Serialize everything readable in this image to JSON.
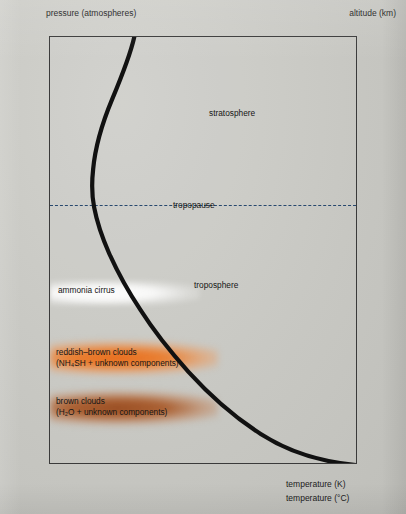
{
  "axes": {
    "pressure_title": "pressure (atmospheres)",
    "altitude_title": "altitude (km)",
    "temperature_k_title": "temperature (K)",
    "temperature_c_title": "temperature (°C)",
    "pressure_ticks": [
      "0.01",
      "0.05",
      "0.1",
      "0.5",
      "1",
      "5",
      "10"
    ],
    "altitude_ticks": [
      "140",
      "120",
      "100",
      "80",
      "60",
      "40",
      "20",
      "0"
    ],
    "temperature_k_ticks": [
      "120",
      "200",
      "280",
      "360"
    ],
    "temperature_c_ticks": [
      "−153",
      "−73",
      "+7",
      "+87"
    ]
  },
  "labels": {
    "stratosphere": "stratosphere",
    "troposphere": "troposphere",
    "tropopause": "tropopause",
    "ammonia_cirrus": "ammonia cirrus",
    "reddish_brown_line1": "reddish–brown clouds",
    "reddish_brown_line2": "(NH₄SH + unknown components)",
    "brown_line1": "brown clouds",
    "brown_line2": "(H₂O + unknown components)"
  },
  "colors": {
    "background": "#c9c9c4",
    "frame": "#3a3a3a",
    "curve": "#111111",
    "tropopause_dash": "#27486e",
    "reddish_brown_cloud": "#e86a18",
    "brown_cloud": "#96481c",
    "ammonia_cirrus": "#ffffff"
  },
  "chart_data": {
    "type": "line",
    "title": "",
    "xlabel": "temperature (K)",
    "ylabel": "pressure (atmospheres)",
    "xlim": [
      120,
      360
    ],
    "ylim_pressure": [
      0.01,
      10
    ],
    "y_scale": "log-inverted",
    "secondary_ylabel": "altitude (km)",
    "secondary_ylim": [
      0,
      140
    ],
    "secondary_xlabel": "temperature (°C)",
    "secondary_xlim": [
      -153,
      87
    ],
    "grid": false,
    "legend": null,
    "series": [
      {
        "name": "Jupiter temperature profile",
        "color": "#111111",
        "points": [
          {
            "temperature_k": 160,
            "pressure_atm": 0.01,
            "altitude_km": 147
          },
          {
            "temperature_k": 158,
            "pressure_atm": 0.013,
            "altitude_km": 143
          },
          {
            "temperature_k": 152,
            "pressure_atm": 0.018,
            "altitude_km": 137
          },
          {
            "temperature_k": 146,
            "pressure_atm": 0.026,
            "altitude_km": 130
          },
          {
            "temperature_k": 140,
            "pressure_atm": 0.038,
            "altitude_km": 121
          },
          {
            "temperature_k": 133,
            "pressure_atm": 0.055,
            "altitude_km": 111
          },
          {
            "temperature_k": 126,
            "pressure_atm": 0.08,
            "altitude_km": 101
          },
          {
            "temperature_k": 120,
            "pressure_atm": 0.115,
            "altitude_km": 93
          },
          {
            "temperature_k": 117,
            "pressure_atm": 0.15,
            "altitude_km": 88
          },
          {
            "temperature_k": 118,
            "pressure_atm": 0.2,
            "altitude_km": 82
          },
          {
            "temperature_k": 124,
            "pressure_atm": 0.3,
            "altitude_km": 73
          },
          {
            "temperature_k": 132,
            "pressure_atm": 0.42,
            "altitude_km": 65
          },
          {
            "temperature_k": 142,
            "pressure_atm": 0.58,
            "altitude_km": 57
          },
          {
            "temperature_k": 155,
            "pressure_atm": 0.8,
            "altitude_km": 49
          },
          {
            "temperature_k": 170,
            "pressure_atm": 1.15,
            "altitude_km": 40
          },
          {
            "temperature_k": 190,
            "pressure_atm": 1.7,
            "altitude_km": 31
          },
          {
            "temperature_k": 212,
            "pressure_atm": 2.5,
            "altitude_km": 22
          },
          {
            "temperature_k": 240,
            "pressure_atm": 3.7,
            "altitude_km": 12
          },
          {
            "temperature_k": 272,
            "pressure_atm": 5.5,
            "altitude_km": 3
          },
          {
            "temperature_k": 305,
            "pressure_atm": 7.6,
            "altitude_km": -4
          },
          {
            "temperature_k": 340,
            "pressure_atm": 9.6,
            "altitude_km": -10
          },
          {
            "temperature_k": 360,
            "pressure_atm": 10.0,
            "altitude_km": -12
          }
        ]
      }
    ],
    "annotations": [
      {
        "text": "stratosphere",
        "pressure_atm": 0.03,
        "temperature_k": 225
      },
      {
        "text": "troposphere",
        "pressure_atm": 0.62,
        "temperature_k": 218
      },
      {
        "text": "tropopause",
        "pressure_atm": 0.15,
        "temperature_k": 150,
        "style": "dashed-line"
      },
      {
        "text": "ammonia cirrus",
        "pressure_atm": 0.55,
        "temperature_k": 128,
        "band": true
      },
      {
        "text": "reddish–brown clouds (NH₄SH + unknown components)",
        "pressure_atm": 1.6,
        "band": true
      },
      {
        "text": "brown clouds (H₂O + unknown components)",
        "pressure_atm": 3.4,
        "band": true
      }
    ]
  }
}
